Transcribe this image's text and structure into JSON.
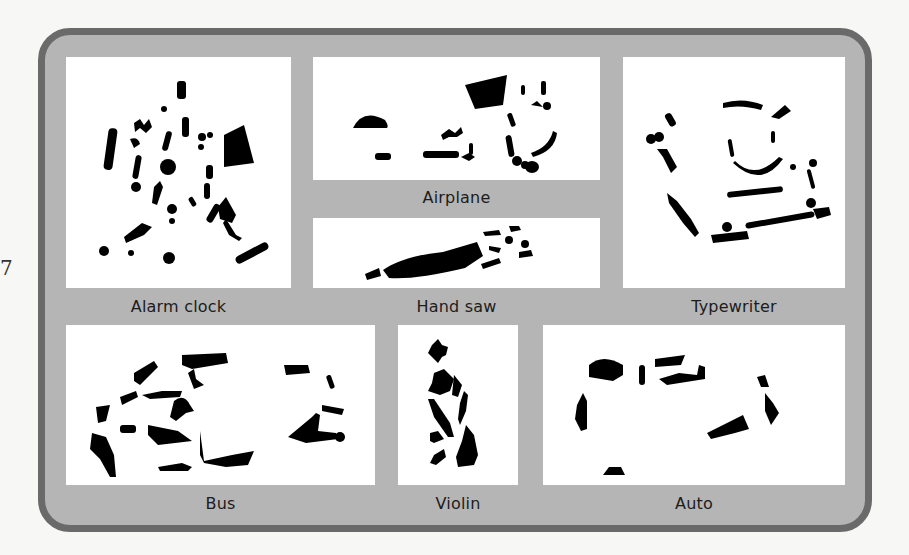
{
  "figure": {
    "margin_mark": "7",
    "colors": {
      "frame_border": "#6a6a6a",
      "frame_fill": "#b5b5b5",
      "panel_fill": "#ffffff",
      "silhouette": "#000000"
    },
    "panels": [
      {
        "id": "alarm-clock",
        "label": "Alarm clock"
      },
      {
        "id": "airplane",
        "label": "Airplane"
      },
      {
        "id": "hand-saw",
        "label": "Hand saw"
      },
      {
        "id": "typewriter",
        "label": "Typewriter"
      },
      {
        "id": "bus",
        "label": "Bus"
      },
      {
        "id": "violin",
        "label": "Violin"
      },
      {
        "id": "auto",
        "label": "Auto"
      }
    ]
  }
}
